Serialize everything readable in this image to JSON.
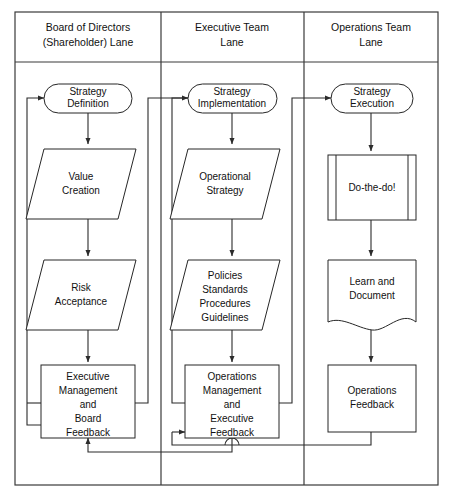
{
  "diagram": {
    "type": "swimlane-flowchart",
    "stroke_color": "#262626",
    "frame_color": "#3a3a3a",
    "background_color": "#ffffff"
  },
  "lanes": [
    {
      "id": "board",
      "title_lines": [
        "Board of Directors",
        "(Shareholder) Lane"
      ],
      "nodes": [
        {
          "id": "strategy-definition",
          "shape": "terminator",
          "lines": [
            "Strategy",
            "Definition"
          ]
        },
        {
          "id": "value-creation",
          "shape": "parallelogram",
          "lines": [
            "Value",
            "Creation"
          ]
        },
        {
          "id": "risk-acceptance",
          "shape": "parallelogram",
          "lines": [
            "Risk",
            "Acceptance"
          ]
        },
        {
          "id": "executive-management-and-board-feedback",
          "shape": "rectangle",
          "lines": [
            "Executive",
            "Management",
            "and",
            "Board",
            "Feedback"
          ]
        }
      ]
    },
    {
      "id": "executive",
      "title_lines": [
        "Executive Team",
        "Lane"
      ],
      "nodes": [
        {
          "id": "strategy-implementation",
          "shape": "terminator",
          "lines": [
            "Strategy",
            "Implementation"
          ]
        },
        {
          "id": "operational-strategy",
          "shape": "parallelogram",
          "lines": [
            "Operational",
            "Strategy"
          ]
        },
        {
          "id": "policies-standards-procedures-guidelines",
          "shape": "parallelogram",
          "lines": [
            "Policies",
            "Standards",
            "Procedures",
            "Guidelines"
          ]
        },
        {
          "id": "operations-management-and-executive-feedback",
          "shape": "rectangle",
          "lines": [
            "Operations",
            "Management",
            "and",
            "Executive",
            "Feedback"
          ]
        }
      ]
    },
    {
      "id": "operations",
      "title_lines": [
        "Operations Team",
        "Lane"
      ],
      "nodes": [
        {
          "id": "strategy-execution",
          "shape": "terminator",
          "lines": [
            "Strategy",
            "Execution"
          ]
        },
        {
          "id": "do-the-do",
          "shape": "predefined-process",
          "lines": [
            "Do-the-do!"
          ]
        },
        {
          "id": "learn-and-document",
          "shape": "document",
          "lines": [
            "Learn and",
            "Document"
          ]
        },
        {
          "id": "operations-feedback",
          "shape": "rectangle",
          "lines": [
            "Operations",
            "Feedback"
          ]
        }
      ]
    }
  ],
  "connectors": [
    {
      "id": "strategy-definition-to-value-creation",
      "kind": "arrow-down"
    },
    {
      "id": "value-creation-to-risk-acceptance",
      "kind": "arrow-down"
    },
    {
      "id": "risk-acceptance-to-executive-management",
      "kind": "arrow-down"
    },
    {
      "id": "executive-management-loop-to-strategy-definition",
      "kind": "feedback-loop-left"
    },
    {
      "id": "executive-management-to-strategy-implementation",
      "kind": "cross-lane-arrow"
    },
    {
      "id": "strategy-implementation-to-operational-strategy",
      "kind": "arrow-down"
    },
    {
      "id": "operational-strategy-to-policies",
      "kind": "arrow-down"
    },
    {
      "id": "policies-to-operations-management",
      "kind": "arrow-down"
    },
    {
      "id": "operations-management-loop-to-strategy-implementation",
      "kind": "feedback-loop-left"
    },
    {
      "id": "operations-management-to-strategy-execution",
      "kind": "cross-lane-arrow"
    },
    {
      "id": "strategy-execution-to-do-the-do",
      "kind": "arrow-down"
    },
    {
      "id": "do-the-do-to-learn-and-document",
      "kind": "arrow-down"
    },
    {
      "id": "learn-and-document-to-operations-feedback",
      "kind": "arrow-down"
    },
    {
      "id": "operations-feedback-to-operations-management",
      "kind": "feedback-return"
    },
    {
      "id": "operations-management-to-executive-management",
      "kind": "feedback-return"
    }
  ]
}
